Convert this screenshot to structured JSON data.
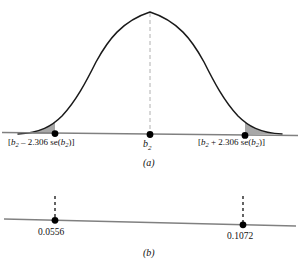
{
  "figure": {
    "panel_a": {
      "panel_label": "(a)",
      "curve": {
        "type": "normal-density",
        "peak_x": 150,
        "peak_y": 12,
        "baseline_y": 134
      },
      "center_marker": {
        "label_prefix": "b",
        "label_subscript": "2",
        "x": 150
      },
      "lower_bound": {
        "open_bracket": "[",
        "symbol": "b",
        "subscript": "2",
        "operator": "–",
        "critical_value": "2.306",
        "se_text": "se(",
        "se_symbol": "b",
        "se_subscript": "2",
        "close_text": ")]",
        "x": 55
      },
      "upper_bound": {
        "open_bracket": "[",
        "symbol": "b",
        "subscript": "2",
        "operator": "+",
        "critical_value": "2.306",
        "se_text": "se(",
        "se_symbol": "b",
        "se_subscript": "2",
        "close_text": ")]",
        "x": 245
      },
      "shaded_tails": {
        "fill_color": "#a8a8a8",
        "left_from_x": 20,
        "left_to_x": 55,
        "right_from_x": 245,
        "right_to_x": 284
      }
    },
    "panel_b": {
      "panel_label": "(b)",
      "lower_value": "0.0556",
      "upper_value": "0.1072",
      "lower_x": 55,
      "upper_x": 243
    },
    "colors": {
      "curve_stroke": "#1a1a1a",
      "axis_stroke": "#808080",
      "dot_fill": "#000000",
      "shade_fill": "#a8a8a8",
      "dashed_center": "#b0b0b0",
      "dashed_marker": "#111111",
      "background": "#ffffff"
    }
  }
}
